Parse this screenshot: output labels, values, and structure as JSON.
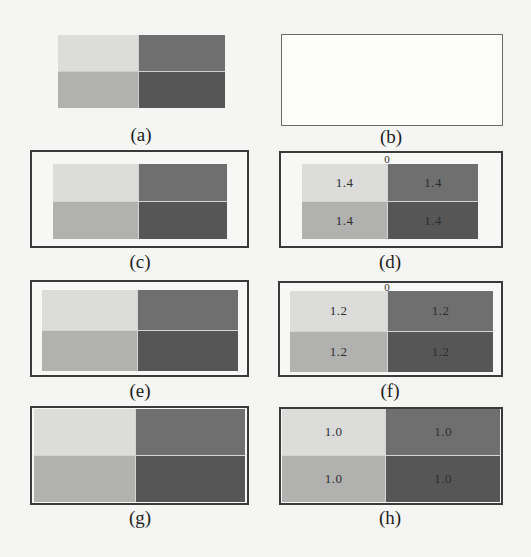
{
  "figure": {
    "colors": {
      "top_left": "#dcdcda",
      "top_right": "#6f6f6f",
      "bottom_left": "#b1b1b0",
      "bottom_right": "#565656",
      "divider": "#d4d4d2",
      "border": "#3a3a3a"
    },
    "panels": [
      {
        "id": "a",
        "caption": "(a)",
        "origin_label": "",
        "cells": [
          "",
          "",
          "",
          ""
        ]
      },
      {
        "id": "b",
        "caption": "(b)",
        "origin_label": "",
        "cells": []
      },
      {
        "id": "c",
        "caption": "(c)",
        "origin_label": "",
        "cells": [
          "",
          "",
          "",
          ""
        ]
      },
      {
        "id": "d",
        "caption": "(d)",
        "origin_label": "0",
        "cells": [
          "1.4",
          "1.4",
          "1.4",
          "1.4"
        ]
      },
      {
        "id": "e",
        "caption": "(e)",
        "origin_label": "",
        "cells": [
          "",
          "",
          "",
          ""
        ]
      },
      {
        "id": "f",
        "caption": "(f)",
        "origin_label": "0",
        "cells": [
          "1.2",
          "1.2",
          "1.2",
          "1.2"
        ]
      },
      {
        "id": "g",
        "caption": "(g)",
        "origin_label": "",
        "cells": [
          "",
          "",
          "",
          ""
        ]
      },
      {
        "id": "h",
        "caption": "(h)",
        "origin_label": "",
        "cells": [
          "1.0",
          "1.0",
          "1.0",
          "1.0"
        ]
      }
    ]
  }
}
